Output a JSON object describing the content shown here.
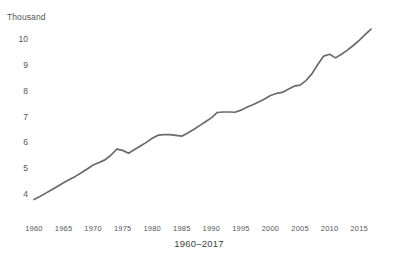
{
  "chart_data": {
    "type": "line",
    "title": "",
    "subtitle": "",
    "unit_label": "Thousand",
    "xlabel": "1960–2017",
    "ylabel": "",
    "xlim": [
      1960,
      2017
    ],
    "ylim": [
      3.55,
      10.75
    ],
    "grid": false,
    "legend": false,
    "line_color": "#6a6a6e",
    "x_ticks": [
      1960,
      1965,
      1970,
      1975,
      1980,
      1985,
      1990,
      1995,
      2000,
      2005,
      2010,
      2015
    ],
    "y_ticks": [
      4,
      5,
      6,
      7,
      8,
      9,
      10
    ],
    "x": [
      1960,
      1961,
      1962,
      1963,
      1964,
      1965,
      1966,
      1967,
      1968,
      1969,
      1970,
      1971,
      1972,
      1973,
      1974,
      1975,
      1976,
      1977,
      1978,
      1979,
      1980,
      1981,
      1982,
      1983,
      1984,
      1985,
      1986,
      1987,
      1988,
      1989,
      1990,
      1991,
      1992,
      1993,
      1994,
      1995,
      1996,
      1997,
      1998,
      1999,
      2000,
      2001,
      2002,
      2003,
      2004,
      2005,
      2006,
      2007,
      2008,
      2009,
      2010,
      2011,
      2012,
      2013,
      2014,
      2015,
      2016,
      2017
    ],
    "values": [
      3.78,
      3.9,
      4.03,
      4.16,
      4.3,
      4.43,
      4.56,
      4.68,
      4.82,
      4.97,
      5.12,
      5.22,
      5.32,
      5.5,
      5.74,
      5.69,
      5.58,
      5.72,
      5.86,
      6.0,
      6.16,
      6.28,
      6.3,
      6.3,
      6.27,
      6.24,
      6.36,
      6.5,
      6.65,
      6.8,
      6.95,
      7.16,
      7.18,
      7.18,
      7.17,
      7.25,
      7.36,
      7.46,
      7.57,
      7.68,
      7.82,
      7.9,
      7.94,
      8.06,
      8.18,
      8.22,
      8.4,
      8.66,
      9.02,
      9.35,
      9.42,
      9.28,
      9.42,
      9.58,
      9.76,
      9.96,
      10.18,
      10.4
    ],
    "series": [
      {
        "name": "value",
        "values": [
          3.78,
          3.9,
          4.03,
          4.16,
          4.3,
          4.43,
          4.56,
          4.68,
          4.82,
          4.97,
          5.12,
          5.22,
          5.32,
          5.5,
          5.74,
          5.69,
          5.58,
          5.72,
          5.86,
          6.0,
          6.16,
          6.28,
          6.3,
          6.3,
          6.27,
          6.24,
          6.36,
          6.5,
          6.65,
          6.8,
          6.95,
          7.16,
          7.18,
          7.18,
          7.17,
          7.25,
          7.36,
          7.46,
          7.57,
          7.68,
          7.82,
          7.9,
          7.94,
          8.06,
          8.18,
          8.22,
          8.4,
          8.66,
          9.02,
          9.35,
          9.42,
          9.28,
          9.42,
          9.58,
          9.76,
          9.96,
          10.18,
          10.4
        ]
      }
    ],
    "annotations": []
  }
}
